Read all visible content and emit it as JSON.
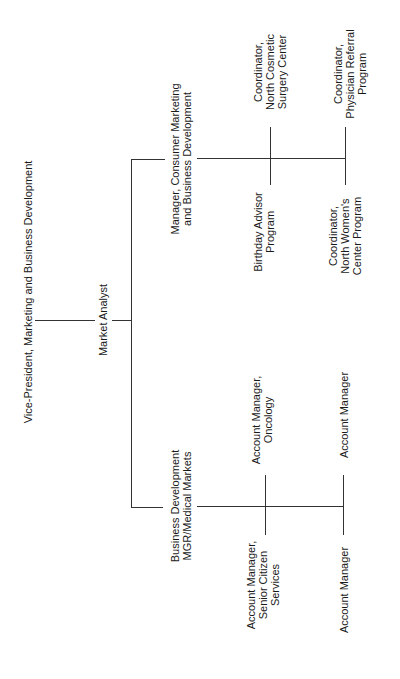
{
  "chart": {
    "orientation": "rotated-90-ccw",
    "line_color": "#333333",
    "root": {
      "title": "Vice-President, Marketing and Business Development"
    },
    "level1": {
      "title": "Market Analyst"
    },
    "branches": [
      {
        "lines": [
          "Manager, Consumer Marketing",
          "and Business Development"
        ],
        "children": [
          {
            "lines": [
              "Birthday Advisor",
              "Program"
            ]
          },
          {
            "lines": [
              "Coordinator,",
              "North Cosmetic",
              "Surgery Center"
            ]
          },
          {
            "lines": [
              "Coordinator,",
              "North Women's",
              "Center Program"
            ]
          },
          {
            "lines": [
              "Coordinator,",
              "Physician Referral",
              "Program"
            ]
          }
        ]
      },
      {
        "lines": [
          "Business Development",
          "MGR/Medical Markets"
        ],
        "children": [
          {
            "lines": [
              "Account Manager,",
              "Senior Citizen",
              "Services"
            ]
          },
          {
            "lines": [
              "Account Manager,",
              "Oncology"
            ]
          },
          {
            "lines": [
              "Account Manager"
            ]
          },
          {
            "lines": [
              "Account Manager"
            ]
          }
        ]
      }
    ]
  }
}
